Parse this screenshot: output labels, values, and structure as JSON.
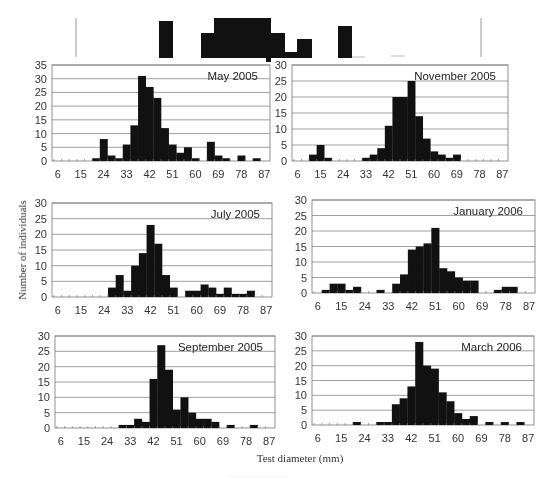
{
  "figure": {
    "ylabel": "Number of individuals",
    "xlabel": "Test diameter (mm)",
    "bar_color": "#111111",
    "grid_color": "#888888"
  },
  "chart_data": [
    {
      "type": "bar",
      "title": "May 2005",
      "xlabel": "Test diameter (mm)",
      "ylabel": "Number of individuals",
      "ylim": [
        0,
        35
      ],
      "yticks": [
        0,
        5,
        10,
        15,
        20,
        25,
        30,
        35
      ],
      "xtick_labels": [
        "6",
        "15",
        "24",
        "33",
        "42",
        "51",
        "60",
        "69",
        "78",
        "87"
      ],
      "categories": [
        6,
        9,
        12,
        15,
        18,
        21,
        24,
        27,
        30,
        33,
        36,
        39,
        42,
        45,
        48,
        51,
        54,
        57,
        60,
        63,
        66,
        69,
        72,
        75,
        78,
        81,
        84,
        87
      ],
      "values": [
        0,
        0,
        0,
        0,
        0,
        1,
        8,
        2,
        1,
        6,
        13,
        31,
        27,
        23,
        12,
        6,
        3,
        5,
        1,
        0,
        7,
        2,
        1,
        0,
        2,
        0,
        1,
        0
      ],
      "grid": true
    },
    {
      "type": "bar",
      "title": "November  2005",
      "xlabel": "Test diameter (mm)",
      "ylabel": "Number of individuals",
      "ylim": [
        0,
        30
      ],
      "yticks": [
        0,
        5,
        10,
        15,
        20,
        25,
        30
      ],
      "xtick_labels": [
        "6",
        "15",
        "24",
        "33",
        "42",
        "51",
        "60",
        "69",
        "78",
        "87"
      ],
      "categories": [
        6,
        9,
        12,
        15,
        18,
        21,
        24,
        27,
        30,
        33,
        36,
        39,
        42,
        45,
        48,
        51,
        54,
        57,
        60,
        63,
        66,
        69,
        72,
        75,
        78,
        81,
        84,
        87
      ],
      "values": [
        0,
        0,
        2,
        5,
        1,
        0,
        0,
        0,
        0,
        1,
        2,
        4,
        11,
        20,
        20,
        25,
        14,
        7,
        3,
        2,
        1,
        2,
        0,
        0,
        0,
        0,
        0,
        0
      ],
      "grid": true
    },
    {
      "type": "bar",
      "title": "July 2005",
      "xlabel": "Test diameter (mm)",
      "ylabel": "Number of individuals",
      "ylim": [
        0,
        30
      ],
      "yticks": [
        0,
        5,
        10,
        15,
        20,
        25,
        30
      ],
      "xtick_labels": [
        "6",
        "15",
        "24",
        "33",
        "42",
        "51",
        "60",
        "69",
        "78",
        "87"
      ],
      "categories": [
        6,
        9,
        12,
        15,
        18,
        21,
        24,
        27,
        30,
        33,
        36,
        39,
        42,
        45,
        48,
        51,
        54,
        57,
        60,
        63,
        66,
        69,
        72,
        75,
        78,
        81,
        84,
        87
      ],
      "values": [
        0,
        0,
        0,
        0,
        0,
        0,
        0,
        3,
        7,
        2,
        10,
        14,
        23,
        17,
        7,
        3,
        0,
        2,
        2,
        4,
        3,
        1,
        3,
        1,
        1,
        2,
        0,
        0
      ],
      "grid": true
    },
    {
      "type": "bar",
      "title": "January 2006",
      "xlabel": "Test diameter (mm)",
      "ylabel": "Number of individuals",
      "ylim": [
        0,
        30
      ],
      "yticks": [
        0,
        5,
        10,
        15,
        20,
        25,
        30
      ],
      "xtick_labels": [
        "6",
        "15",
        "24",
        "33",
        "42",
        "51",
        "60",
        "69",
        "78",
        "87"
      ],
      "categories": [
        6,
        9,
        12,
        15,
        18,
        21,
        24,
        27,
        30,
        33,
        36,
        39,
        42,
        45,
        48,
        51,
        54,
        57,
        60,
        63,
        66,
        69,
        72,
        75,
        78,
        81,
        84,
        87
      ],
      "values": [
        0,
        1,
        3,
        3,
        1,
        2,
        0,
        0,
        1,
        0,
        3,
        6,
        14,
        15,
        16,
        21,
        8,
        7,
        5,
        4,
        4,
        0,
        0,
        1,
        2,
        2,
        0,
        0
      ],
      "grid": true
    },
    {
      "type": "bar",
      "title": "September 2005",
      "xlabel": "Test diameter (mm)",
      "ylabel": "Number of individuals",
      "ylim": [
        0,
        30
      ],
      "yticks": [
        0,
        5,
        10,
        15,
        20,
        25,
        30
      ],
      "xtick_labels": [
        "6",
        "15",
        "24",
        "33",
        "42",
        "51",
        "60",
        "69",
        "78",
        "87"
      ],
      "categories": [
        6,
        9,
        12,
        15,
        18,
        21,
        24,
        27,
        30,
        33,
        36,
        39,
        42,
        45,
        48,
        51,
        54,
        57,
        60,
        63,
        66,
        69,
        72,
        75,
        78,
        81,
        84,
        87
      ],
      "values": [
        0,
        0,
        0,
        0,
        0,
        0,
        0,
        0,
        1,
        1,
        3,
        2,
        16,
        27,
        19,
        6,
        10,
        5,
        3,
        3,
        2,
        0,
        1,
        0,
        0,
        1,
        0,
        0
      ],
      "grid": true
    },
    {
      "type": "bar",
      "title": "March 2006",
      "xlabel": "Test diameter (mm)",
      "ylabel": "Number of individuals",
      "ylim": [
        0,
        30
      ],
      "yticks": [
        0,
        5,
        10,
        15,
        20,
        25,
        30
      ],
      "xtick_labels": [
        "6",
        "15",
        "24",
        "33",
        "42",
        "51",
        "60",
        "69",
        "78",
        "87"
      ],
      "categories": [
        6,
        9,
        12,
        15,
        18,
        21,
        24,
        27,
        30,
        33,
        36,
        39,
        42,
        45,
        48,
        51,
        54,
        57,
        60,
        63,
        66,
        69,
        72,
        75,
        78,
        81,
        84,
        87
      ],
      "values": [
        0,
        0,
        0,
        0,
        0,
        1,
        0,
        0,
        1,
        1,
        7,
        9,
        13,
        28,
        20,
        19,
        11,
        8,
        4,
        2,
        3,
        0,
        1,
        0,
        1,
        0,
        1,
        0
      ],
      "grid": true
    }
  ]
}
